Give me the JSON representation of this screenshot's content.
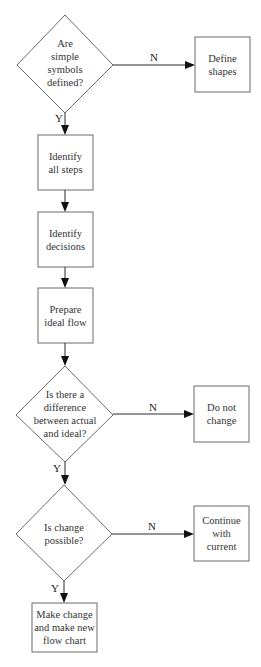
{
  "diagram": {
    "type": "flowchart",
    "nodes": [
      {
        "id": "d1",
        "shape": "diamond",
        "lines": [
          "Are",
          "simple",
          "symbols",
          "defined?"
        ]
      },
      {
        "id": "r_define",
        "shape": "rect",
        "lines": [
          "Define",
          "shapes"
        ]
      },
      {
        "id": "r_steps",
        "shape": "rect",
        "lines": [
          "Identify",
          "all steps"
        ]
      },
      {
        "id": "r_decisions",
        "shape": "rect",
        "lines": [
          "Identify",
          "decisions"
        ]
      },
      {
        "id": "r_prepare",
        "shape": "rect",
        "lines": [
          "Prepare",
          "ideal flow"
        ]
      },
      {
        "id": "d2",
        "shape": "diamond",
        "lines": [
          "Is there a",
          "difference",
          "between actual",
          "and ideal?"
        ]
      },
      {
        "id": "r_donot",
        "shape": "rect",
        "lines": [
          "Do not",
          "change"
        ]
      },
      {
        "id": "d3",
        "shape": "diamond",
        "lines": [
          "Is change",
          "possible?"
        ]
      },
      {
        "id": "r_continue",
        "shape": "rect",
        "lines": [
          "Continue",
          "with",
          "current"
        ]
      },
      {
        "id": "r_make",
        "shape": "rect",
        "lines": [
          "Make change",
          "and make new",
          "flow chart"
        ]
      }
    ],
    "edges": [
      {
        "from": "d1",
        "to": "r_define",
        "label": "N"
      },
      {
        "from": "d1",
        "to": "r_steps",
        "label": "Y"
      },
      {
        "from": "r_steps",
        "to": "r_decisions",
        "label": ""
      },
      {
        "from": "r_decisions",
        "to": "r_prepare",
        "label": ""
      },
      {
        "from": "r_prepare",
        "to": "d2",
        "label": ""
      },
      {
        "from": "d2",
        "to": "r_donot",
        "label": "N"
      },
      {
        "from": "d2",
        "to": "d3",
        "label": "Y"
      },
      {
        "from": "d3",
        "to": "r_continue",
        "label": "N"
      },
      {
        "from": "d3",
        "to": "r_make",
        "label": "Y"
      }
    ]
  },
  "labels": {
    "d1": {
      "l0": "Are",
      "l1": "simple",
      "l2": "symbols",
      "l3": "defined?"
    },
    "define": {
      "l0": "Define",
      "l1": "shapes"
    },
    "steps": {
      "l0": "Identify",
      "l1": "all steps"
    },
    "decisions": {
      "l0": "Identify",
      "l1": "decisions"
    },
    "prepare": {
      "l0": "Prepare",
      "l1": "ideal flow"
    },
    "d2": {
      "l0": "Is there a",
      "l1": "difference",
      "l2": "between actual",
      "l3": "and ideal?"
    },
    "donot": {
      "l0": "Do not",
      "l1": "change"
    },
    "d3": {
      "l0": "Is change",
      "l1": "possible?"
    },
    "cont": {
      "l0": "Continue",
      "l1": "with",
      "l2": "current"
    },
    "make": {
      "l0": "Make change",
      "l1": "and make new",
      "l2": "flow chart"
    },
    "edge_no": "N",
    "edge_yes": "Y"
  },
  "colors": {
    "background": "#ffffff",
    "stroke": "#6b6b6b",
    "arrow": "#111111",
    "text": "#333333"
  }
}
